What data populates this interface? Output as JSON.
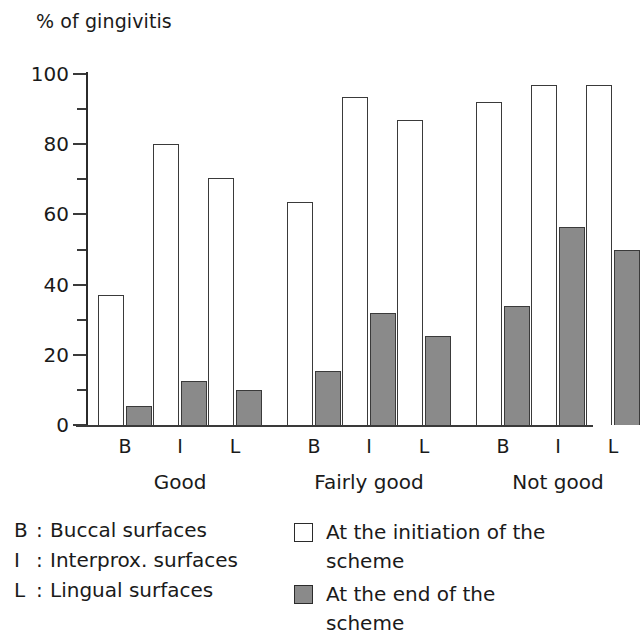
{
  "chart_data": {
    "type": "bar",
    "title": "% of gingivitis",
    "xlabel": "",
    "ylabel": "% of gingivitis",
    "ylim": [
      0,
      100
    ],
    "y_ticks_major": [
      0,
      20,
      40,
      60,
      80,
      100
    ],
    "y_ticks_minor": [
      10,
      30,
      50,
      70,
      90
    ],
    "grid": false,
    "legend_position": "bottom-right",
    "groups": [
      "Good",
      "Fairly good",
      "Not good"
    ],
    "categories": [
      "B",
      "I",
      "L",
      "B",
      "I",
      "L",
      "B",
      "I",
      "L"
    ],
    "series": [
      {
        "name": "At the initiation of the scheme",
        "color": "#ffffff",
        "values": [
          37,
          80,
          70.5,
          63.5,
          93.5,
          87,
          92,
          97,
          97
        ]
      },
      {
        "name": "At the end of the scheme",
        "color": "#8a8a8a",
        "values": [
          5.5,
          12.5,
          10,
          15.5,
          32,
          25.5,
          34,
          56.5,
          50
        ]
      }
    ]
  },
  "axis": {
    "y_title": "% of gingivitis",
    "tick_labels": [
      "100",
      "80",
      "60",
      "40",
      "20",
      "0"
    ]
  },
  "x_axis": {
    "sub_labels": [
      "B",
      "I",
      "L",
      "B",
      "I",
      "L",
      "B",
      "I",
      "L"
    ],
    "group_labels": [
      "Good",
      "Fairly good",
      "Not good"
    ]
  },
  "legend": {
    "abbreviations": [
      {
        "key": "B",
        "colon": ":",
        "text": "Buccal surfaces"
      },
      {
        "key": "I",
        "colon": ":",
        "text": "Interprox. surfaces"
      },
      {
        "key": "L",
        "colon": ":",
        "text": "Lingual surfaces"
      }
    ],
    "series": [
      {
        "swatch": "open-square",
        "label": "At the initiation of the scheme"
      },
      {
        "swatch": "filled-square",
        "label": "At the end of the scheme"
      }
    ]
  },
  "colors": {
    "bar_fill_gray": "#8a8a8a",
    "bar_outline": "#3a3a3a",
    "text": "#1a1a1a",
    "background": "#ffffff"
  }
}
